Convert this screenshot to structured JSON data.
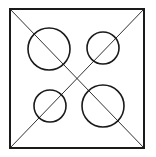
{
  "diagram": {
    "background": "#ffffff",
    "stroke_color": "#1a1a1a",
    "square": {
      "x1": 10,
      "y1": 9,
      "x2": 144,
      "y2": 148,
      "stroke_width": 2
    },
    "diagonals": [
      {
        "name": "diagonal-tl-br",
        "x1": 10,
        "y1": 9,
        "x2": 144,
        "y2": 148,
        "stroke_width": 0.9
      },
      {
        "name": "diagonal-bl-tr",
        "x1": 10,
        "y1": 148,
        "x2": 144,
        "y2": 9,
        "stroke_width": 0.9
      }
    ],
    "circles": [
      {
        "name": "circle-top-left",
        "cx": 49,
        "cy": 49,
        "r": 21,
        "stroke_width": 1.6
      },
      {
        "name": "circle-top-right",
        "cx": 103,
        "cy": 48,
        "r": 16,
        "stroke_width": 1.6
      },
      {
        "name": "circle-bottom-left",
        "cx": 50,
        "cy": 106,
        "r": 16,
        "stroke_width": 1.6
      },
      {
        "name": "circle-bottom-right",
        "cx": 103,
        "cy": 106,
        "r": 21,
        "stroke_width": 1.6
      }
    ]
  }
}
